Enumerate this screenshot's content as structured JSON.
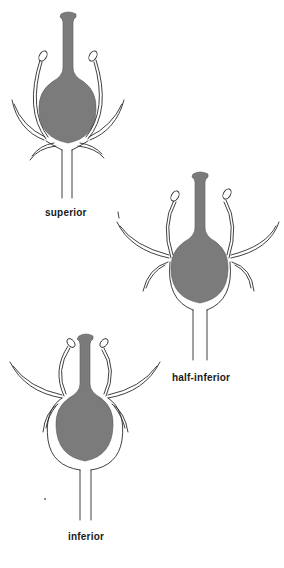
{
  "figure": {
    "fill_color": "#7b7b7b",
    "line_color": "#2a2a2a",
    "flowers": [
      {
        "id": "superior",
        "label": "superior"
      },
      {
        "id": "half-inferior",
        "label": "half-inferior"
      },
      {
        "id": "inferior",
        "label": "inferior"
      }
    ]
  }
}
